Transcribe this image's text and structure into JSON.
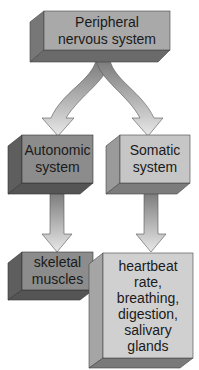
{
  "diagram": {
    "colors": {
      "root_front": "#a9a9a9",
      "autonomic_front": "#8c8c8c",
      "somatic_front": "#c6c6c6",
      "skeletal_front": "#8c8c8c",
      "effects_front": "#d0d0d0",
      "arrow": "#9a9a9a",
      "text": "#1a1a1a"
    },
    "nodes": {
      "root": {
        "lines": [
          "Peripheral",
          "nervous system"
        ]
      },
      "autonomic": {
        "lines": [
          "Autonomic",
          "system"
        ]
      },
      "somatic": {
        "lines": [
          "Somatic",
          "system"
        ]
      },
      "skeletal": {
        "lines": [
          "skeletal",
          "muscles"
        ]
      },
      "effects": {
        "lines": [
          "heartbeat",
          "rate,",
          "breathing,",
          "digestion,",
          "salivary",
          "glands"
        ]
      }
    },
    "edges": [
      {
        "from": "root",
        "to": "autonomic"
      },
      {
        "from": "root",
        "to": "somatic"
      },
      {
        "from": "autonomic",
        "to": "skeletal"
      },
      {
        "from": "somatic",
        "to": "effects"
      }
    ]
  }
}
